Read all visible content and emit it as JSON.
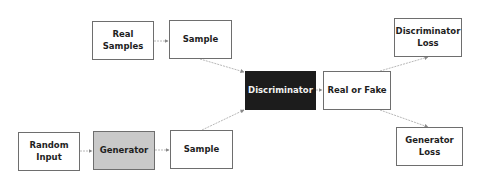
{
  "diagram": {
    "nodes": [
      {
        "id": "real_samples",
        "label": "Real Samples",
        "x": 92,
        "y": 21,
        "w": 62,
        "h": 39,
        "style": "plain"
      },
      {
        "id": "sample_top",
        "label": "Sample",
        "x": 169,
        "y": 20,
        "w": 63,
        "h": 39,
        "style": "plain"
      },
      {
        "id": "random_input",
        "label": "Random\nInput",
        "x": 18,
        "y": 132,
        "w": 62,
        "h": 39,
        "style": "plain"
      },
      {
        "id": "generator",
        "label": "Generator",
        "x": 93,
        "y": 131,
        "w": 62,
        "h": 39,
        "style": "gray"
      },
      {
        "id": "sample_bottom",
        "label": "Sample",
        "x": 170,
        "y": 130,
        "w": 63,
        "h": 39,
        "style": "plain"
      },
      {
        "id": "discriminator",
        "label": "Discriminator",
        "x": 245,
        "y": 71,
        "w": 71,
        "h": 39,
        "style": "dark"
      },
      {
        "id": "real_or_fake",
        "label": "Real or Fake",
        "x": 323,
        "y": 71,
        "w": 68,
        "h": 39,
        "style": "plain"
      },
      {
        "id": "discriminator_loss",
        "label": "Discriminator\nLoss",
        "x": 394,
        "y": 18,
        "w": 68,
        "h": 39,
        "style": "plain"
      },
      {
        "id": "generator_loss",
        "label": "Generator\nLoss",
        "x": 396,
        "y": 127,
        "w": 67,
        "h": 39,
        "style": "plain"
      }
    ],
    "edges": [
      {
        "from": "real_samples",
        "to": "sample_top",
        "x1": 154,
        "y1": 41,
        "x2": 168,
        "y2": 41
      },
      {
        "from": "random_input",
        "to": "generator",
        "x1": 80,
        "y1": 151,
        "x2": 92,
        "y2": 151
      },
      {
        "from": "generator",
        "to": "sample_bottom",
        "x1": 155,
        "y1": 150,
        "x2": 169,
        "y2": 150
      },
      {
        "from": "sample_top",
        "to": "discriminator",
        "x1": 200,
        "y1": 59,
        "x2": 244,
        "y2": 72
      },
      {
        "from": "sample_bottom",
        "to": "discriminator",
        "x1": 202,
        "y1": 130,
        "x2": 244,
        "y2": 110
      },
      {
        "from": "discriminator",
        "to": "real_or_fake",
        "x1": 316,
        "y1": 90,
        "x2": 322,
        "y2": 90
      },
      {
        "from": "real_or_fake",
        "to": "discriminator_loss",
        "x1": 380,
        "y1": 71,
        "x2": 428,
        "y2": 57
      },
      {
        "from": "real_or_fake",
        "to": "generator_loss",
        "x1": 380,
        "y1": 110,
        "x2": 428,
        "y2": 127
      }
    ],
    "colors": {
      "edge": "#b8b8b8",
      "border": "#6e6e6e",
      "generator_fill": "#c9c9c9",
      "discriminator_fill": "#1c1c1c"
    }
  }
}
